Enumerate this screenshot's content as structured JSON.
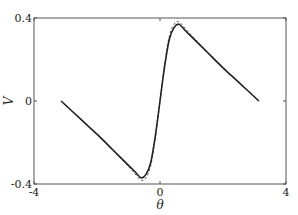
{
  "chart_data": {
    "type": "line",
    "title": "",
    "xlabel": "θ",
    "ylabel": "V",
    "xlim": [
      -4,
      4
    ],
    "ylim": [
      -0.4,
      0.4
    ],
    "xticks": [
      -4,
      0,
      4
    ],
    "xtick_labels": [
      "-4",
      "0",
      "4"
    ],
    "yticks": [
      -0.4,
      0,
      0.4
    ],
    "ytick_labels": [
      "-0.4",
      "0",
      "0.4"
    ],
    "grid": false,
    "legend": null,
    "series": [
      {
        "name": "solid",
        "style": "solid",
        "color": "#222222",
        "x": [
          -3.14,
          -2.5,
          -2.0,
          -1.5,
          -1.2,
          -1.0,
          -0.8,
          -0.6,
          -0.45,
          -0.3,
          -0.15,
          0.0,
          0.15,
          0.3,
          0.45,
          0.6,
          0.8,
          1.0,
          1.2,
          1.5,
          2.0,
          2.5,
          3.14
        ],
        "y": [
          0.0,
          -0.09,
          -0.16,
          -0.235,
          -0.28,
          -0.31,
          -0.34,
          -0.37,
          -0.355,
          -0.3,
          -0.17,
          0.0,
          0.17,
          0.3,
          0.355,
          0.37,
          0.34,
          0.31,
          0.28,
          0.235,
          0.16,
          0.09,
          0.0
        ]
      },
      {
        "name": "dashed",
        "style": "dashed",
        "color": "#555555",
        "x": [
          -3.14,
          -2.5,
          -2.0,
          -1.5,
          -1.2,
          -1.0,
          -0.8,
          -0.6,
          -0.45,
          -0.3,
          -0.15,
          0.0,
          0.15,
          0.3,
          0.45,
          0.6,
          0.8,
          1.0,
          1.2,
          1.5,
          2.0,
          2.5,
          3.14
        ],
        "y": [
          0.0,
          -0.09,
          -0.162,
          -0.238,
          -0.284,
          -0.316,
          -0.35,
          -0.382,
          -0.37,
          -0.315,
          -0.18,
          0.0,
          0.18,
          0.315,
          0.37,
          0.382,
          0.35,
          0.316,
          0.284,
          0.238,
          0.162,
          0.09,
          0.0
        ]
      }
    ]
  },
  "layout": {
    "plot_left": 34,
    "plot_right": 286,
    "plot_top": 18,
    "plot_bottom": 184
  }
}
